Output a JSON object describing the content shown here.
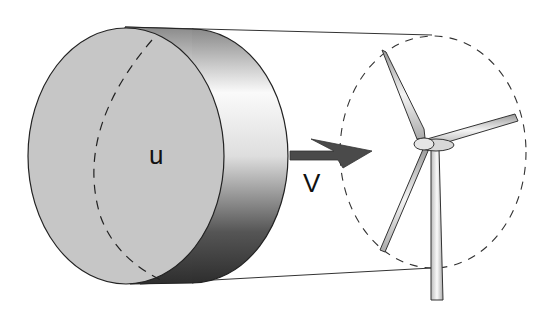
{
  "diagram": {
    "title": "",
    "labels": {
      "upstream_velocity": "u",
      "rotor_velocity": "V"
    },
    "elements": [
      "air-cylinder",
      "flow-arrow",
      "rotor-swept-area",
      "wind-turbine"
    ],
    "colors": {
      "cylinder_face": "#c4c4c4",
      "arrow": "#4a4a4a",
      "outline": "#222222"
    }
  }
}
